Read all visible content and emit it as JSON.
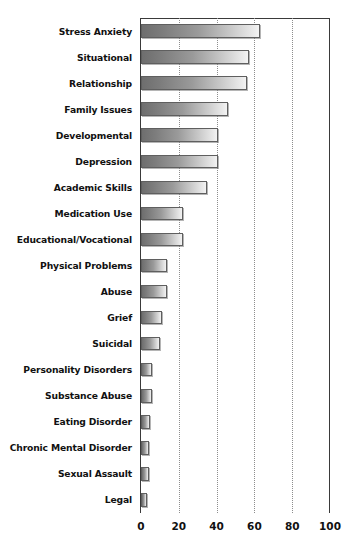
{
  "chart_data": {
    "type": "bar",
    "orientation": "horizontal",
    "title": "",
    "subtitle": "",
    "xlabel": "",
    "ylabel": "",
    "xlim": [
      0,
      100
    ],
    "xticks": [
      0,
      20,
      40,
      60,
      80,
      100
    ],
    "xtick_labels": [
      "0",
      "20",
      "40",
      "60",
      "80",
      "100"
    ],
    "grid": "vertical-dotted",
    "legend": "none",
    "bar_style": "gray-gradient-left-to-right",
    "categories": [
      "Stress Anxiety",
      "Situational",
      "Relationship",
      "Family Issues",
      "Developmental",
      "Depression",
      "Academic Skills",
      "Medication Use",
      "Educational/Vocational",
      "Physical Problems",
      "Abuse",
      "Grief",
      "Suicidal",
      "Personality Disorders",
      "Substance Abuse",
      "Eating Disorder",
      "Chronic Mental Disorder",
      "Sexual Assault",
      "Legal"
    ],
    "values": [
      63,
      57,
      56,
      46,
      41,
      41,
      35,
      22,
      22,
      14,
      14,
      11,
      10,
      6,
      6,
      5,
      4,
      4,
      3
    ],
    "series": [
      {
        "name": "Presenting Concerns",
        "values": [
          63,
          57,
          56,
          46,
          41,
          41,
          35,
          22,
          22,
          14,
          14,
          11,
          10,
          6,
          6,
          5,
          4,
          4,
          3
        ]
      }
    ]
  },
  "axis": {
    "gridline_color": "#8d8d8d",
    "frame_color": "#3a3a3a",
    "bar_border_color": "#5f5f5f",
    "text_color": "#111111"
  }
}
